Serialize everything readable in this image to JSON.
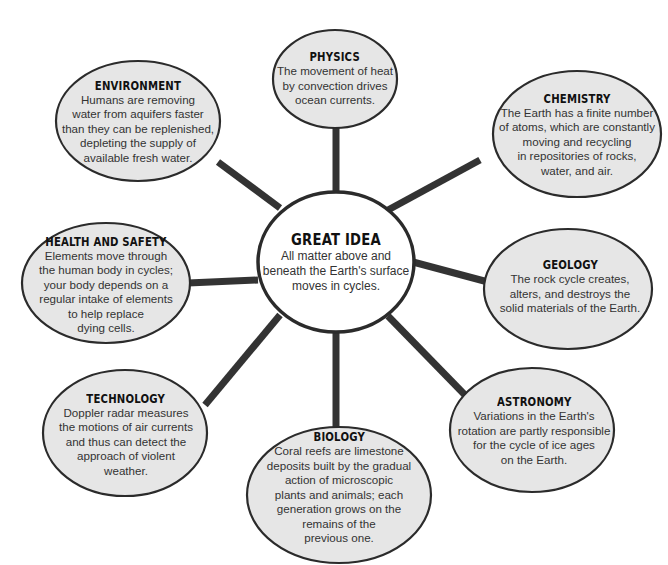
{
  "diagram": {
    "type": "concept web",
    "colors": {
      "connector": "#333333",
      "outline": "#2b2b2b",
      "outer_fill": "#e6e6e6",
      "center_fill": "#ffffff"
    },
    "center": {
      "title": "GREAT IDEA",
      "body": "All matter above and\nbeneath the Earth's surface\nmoves in cycles."
    },
    "nodes": [
      {
        "id": "physics",
        "title": "PHYSICS",
        "body": "The movement of heat\nby convection drives\nocean currents."
      },
      {
        "id": "chemistry",
        "title": "CHEMISTRY",
        "body": "The Earth has a finite number\nof atoms, which are constantly\nmoving and recycling\nin repositories of rocks,\nwater, and air."
      },
      {
        "id": "geology",
        "title": "GEOLOGY",
        "body": "The rock cycle creates,\nalters, and destroys the\nsolid materials of the Earth."
      },
      {
        "id": "astronomy",
        "title": "ASTRONOMY",
        "body": "Variations in the Earth's\nrotation are partly responsible\nfor the cycle of ice ages\non the Earth."
      },
      {
        "id": "biology",
        "title": "BIOLOGY",
        "body": "Coral reefs are limestone\ndeposits built by the gradual\naction of microscopic\nplants and animals; each\ngeneration grows on the\nremains of the\nprevious one."
      },
      {
        "id": "technology",
        "title": "TECHNOLOGY",
        "body": "Doppler radar measures\nthe motions of air currents\nand thus can detect the\napproach of violent\nweather."
      },
      {
        "id": "health",
        "title": "HEALTH AND SAFETY",
        "body": "Elements move through\nthe human body in cycles;\nyour body depends on a\nregular intake of elements\nto help replace\ndying cells."
      },
      {
        "id": "environment",
        "title": "ENVIRONMENT",
        "body": "Humans are removing\nwater from aquifers faster\nthan they can be replenished,\ndepleting the supply of\navailable fresh water."
      }
    ]
  }
}
